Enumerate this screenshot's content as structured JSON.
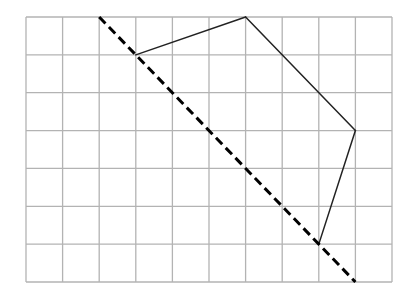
{
  "diagram": {
    "type": "grid-figure",
    "grid": {
      "columns": 10,
      "rows": 7,
      "line_color": "#b3b3b3"
    },
    "symmetry_line": {
      "style": "dashed",
      "color": "#000000",
      "from": [
        2,
        0
      ],
      "to": [
        9,
        7
      ]
    },
    "shape": {
      "color": "#222222",
      "vertices": [
        [
          3,
          1
        ],
        [
          6,
          0
        ],
        [
          9,
          3
        ],
        [
          8,
          6
        ]
      ],
      "drawn_edges": [
        [
          0,
          1
        ],
        [
          1,
          2
        ],
        [
          2,
          3
        ]
      ]
    }
  }
}
